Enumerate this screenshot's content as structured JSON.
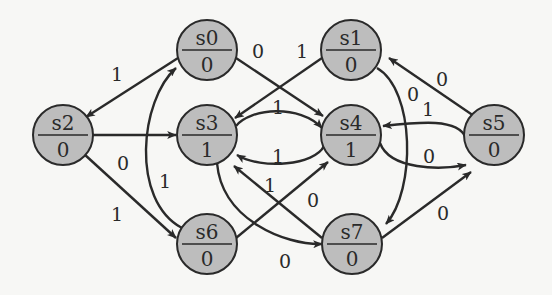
{
  "diagram": {
    "type": "state-machine (Moore)",
    "colors": {
      "background": "#f7f7f5",
      "node_fill": "#bdbdbd",
      "stroke": "#2a2a2a"
    },
    "nodes": [
      {
        "id": "s0",
        "name": "s0",
        "output": "0",
        "cx": 207,
        "cy": 50
      },
      {
        "id": "s1",
        "name": "s1",
        "output": "0",
        "cx": 351,
        "cy": 50
      },
      {
        "id": "s2",
        "name": "s2",
        "output": "0",
        "cx": 63,
        "cy": 135
      },
      {
        "id": "s3",
        "name": "s3",
        "output": "1",
        "cx": 207,
        "cy": 135
      },
      {
        "id": "s4",
        "name": "s4",
        "output": "1",
        "cx": 351,
        "cy": 135
      },
      {
        "id": "s5",
        "name": "s5",
        "output": "0",
        "cx": 494,
        "cy": 135
      },
      {
        "id": "s6",
        "name": "s6",
        "output": "0",
        "cx": 207,
        "cy": 244
      },
      {
        "id": "s7",
        "name": "s7",
        "output": "0",
        "cx": 352,
        "cy": 244
      }
    ],
    "edges": [
      {
        "from": "s0",
        "to": "s2",
        "label": "1"
      },
      {
        "from": "s0",
        "to": "s4",
        "label": "0"
      },
      {
        "from": "s1",
        "to": "s3",
        "label": "1"
      },
      {
        "from": "s1",
        "to": "s7",
        "label": "0"
      },
      {
        "from": "s2",
        "to": "s3",
        "label": "0"
      },
      {
        "from": "s2",
        "to": "s6",
        "label": "1"
      },
      {
        "from": "s3",
        "to": "s4",
        "label": "1"
      },
      {
        "from": "s3",
        "to": "s7",
        "label": "0"
      },
      {
        "from": "s4",
        "to": "s3",
        "label": "1"
      },
      {
        "from": "s4",
        "to": "s5",
        "label": "0"
      },
      {
        "from": "s5",
        "to": "s1",
        "label": "0"
      },
      {
        "from": "s5",
        "to": "s4",
        "label": "1"
      },
      {
        "from": "s6",
        "to": "s0",
        "label": "1"
      },
      {
        "from": "s6",
        "to": "s4",
        "label": "0"
      },
      {
        "from": "s7",
        "to": "s3",
        "label": "1"
      },
      {
        "from": "s7",
        "to": "s5",
        "label": "0"
      }
    ]
  }
}
